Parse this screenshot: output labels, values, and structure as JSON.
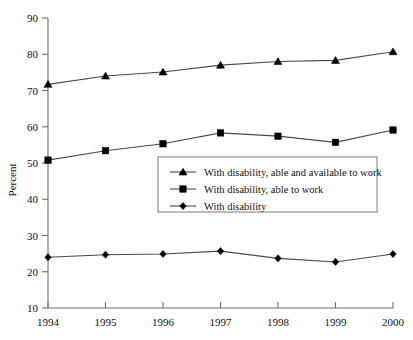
{
  "chart_data": {
    "type": "line",
    "title": "",
    "subtitle": "",
    "xlabel": "",
    "ylabel": "Percent",
    "categories": [
      "1994",
      "1995",
      "1996",
      "1997",
      "1998",
      "1999",
      "2000"
    ],
    "x": [
      1994,
      1995,
      1996,
      1997,
      1998,
      1999,
      2000
    ],
    "ylim": [
      10,
      90
    ],
    "ytick_labels": [
      "10",
      "20",
      "30",
      "40",
      "50",
      "60",
      "70",
      "80",
      "90"
    ],
    "yticks": [
      10,
      20,
      30,
      40,
      50,
      60,
      70,
      80,
      90
    ],
    "grid": false,
    "legend_position": "center",
    "series": [
      {
        "name": "With disability, able and available to work",
        "marker": "triangle",
        "values": [
          71.7,
          74.0,
          75.1,
          77.0,
          78.0,
          78.3,
          80.7
        ]
      },
      {
        "name": "With disability, able to work",
        "marker": "square",
        "values": [
          50.8,
          53.4,
          55.3,
          58.3,
          57.4,
          55.7,
          59.1
        ]
      },
      {
        "name": "With disability",
        "marker": "diamond",
        "values": [
          24.0,
          24.7,
          24.9,
          25.7,
          23.7,
          22.7,
          24.9
        ]
      }
    ]
  },
  "legend": {
    "items": [
      {
        "label": "With disability, able and available to work",
        "marker": "triangle"
      },
      {
        "label": "With disability, able to work",
        "marker": "square"
      },
      {
        "label": "With disability",
        "marker": "diamond"
      }
    ]
  },
  "colors": {
    "line": "#4a4a4a",
    "marker": "#000000",
    "axis": "#6e6e6e",
    "text": "#111111",
    "legend_border": "#7a7a7a",
    "background": "#ffffff"
  }
}
